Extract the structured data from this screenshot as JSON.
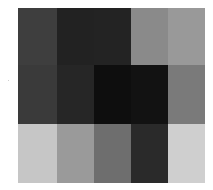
{
  "grid": {
    "rows": 3,
    "cols": 5,
    "cells": [
      [
        "#3e3e3e",
        "#222222",
        "#232323",
        "#8a8a8a",
        "#999999"
      ],
      [
        "#3a3a3a",
        "#262626",
        "#0e0e0e",
        "#121212",
        "#7a7a7a"
      ],
      [
        "#c6c6c6",
        "#9a9a9a",
        "#6e6e6e",
        "#2a2a2a",
        "#cfcfcf"
      ]
    ]
  }
}
